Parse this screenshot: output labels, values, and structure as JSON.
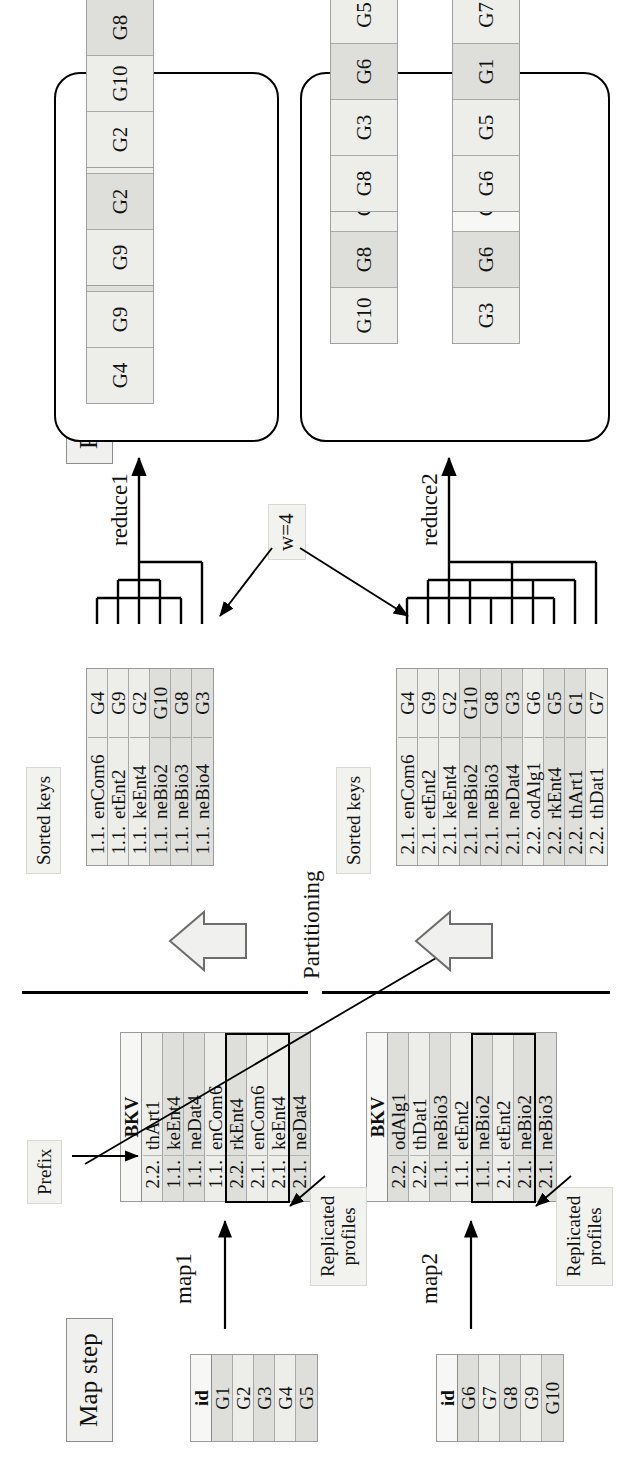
{
  "figure": {
    "orientation": "rotated-90-ccw",
    "steps": {
      "map_label": "Map step",
      "reduce_label": "Reduce step",
      "partitioning_label": "Partitioning",
      "window_label": "w=4"
    },
    "annotations": {
      "prefix": "Prefix",
      "replicated_profiles_line1": "Replicated",
      "replicated_profiles_line2": "profiles",
      "map1": "map1",
      "map2": "map2",
      "reduce1": "reduce1",
      "reduce2": "reduce2",
      "sorted_keys": "Sorted keys"
    }
  },
  "input_tables": [
    {
      "name": "input-block-1",
      "header": "id",
      "rows": [
        {
          "value": "G1",
          "shade": "dark"
        },
        {
          "value": "G2",
          "shade": "light"
        },
        {
          "value": "G3",
          "shade": "dark"
        },
        {
          "value": "G4",
          "shade": "light"
        },
        {
          "value": "G5",
          "shade": "dark"
        }
      ]
    },
    {
      "name": "input-block-2",
      "header": "id",
      "rows": [
        {
          "value": "G6",
          "shade": "dark"
        },
        {
          "value": "G7",
          "shade": "light"
        },
        {
          "value": "G8",
          "shade": "dark"
        },
        {
          "value": "G9",
          "shade": "light"
        },
        {
          "value": "G10",
          "shade": "dark"
        }
      ]
    }
  ],
  "map_outputs": [
    {
      "name": "map1-bkv",
      "header": "BKV",
      "rows": [
        {
          "prefix": "2.2.",
          "key": "thArt1",
          "shade": "light",
          "replicated": false
        },
        {
          "prefix": "1.1.",
          "key": "keEnt4",
          "shade": "dark",
          "replicated": false
        },
        {
          "prefix": "1.1.",
          "key": "neDat4",
          "shade": "dark",
          "replicated": false
        },
        {
          "prefix": "1.1.",
          "key": "enCom6",
          "shade": "light",
          "replicated": false
        },
        {
          "prefix": "2.2.",
          "key": "rkEnt4",
          "shade": "dark",
          "replicated": false
        },
        {
          "prefix": "2.1.",
          "key": "enCom6",
          "shade": "light",
          "replicated": true
        },
        {
          "prefix": "2.1.",
          "key": "keEnt4",
          "shade": "light",
          "replicated": true
        },
        {
          "prefix": "2.1.",
          "key": "neDat4",
          "shade": "dark",
          "replicated": true
        }
      ]
    },
    {
      "name": "map2-bkv",
      "header": "BKV",
      "rows": [
        {
          "prefix": "2.2.",
          "key": "odAlg1",
          "shade": "dark",
          "replicated": false
        },
        {
          "prefix": "2.2.",
          "key": "thDat1",
          "shade": "light",
          "replicated": false
        },
        {
          "prefix": "1.1.",
          "key": "neBio3",
          "shade": "dark",
          "replicated": false
        },
        {
          "prefix": "1.1.",
          "key": "etEnt2",
          "shade": "light",
          "replicated": false
        },
        {
          "prefix": "1.1.",
          "key": "neBio2",
          "shade": "dark",
          "replicated": false
        },
        {
          "prefix": "2.1.",
          "key": "etEnt2",
          "shade": "light",
          "replicated": true
        },
        {
          "prefix": "2.1.",
          "key": "neBio2",
          "shade": "dark",
          "replicated": true
        },
        {
          "prefix": "2.1.",
          "key": "neBio3",
          "shade": "dark",
          "replicated": true
        }
      ]
    }
  ],
  "sorted_key_tables": [
    {
      "name": "sorted-keys-1",
      "label": "Sorted keys",
      "rows": [
        {
          "prefix": "1.1.",
          "key": "enCom6",
          "group": "G4",
          "shade": "light"
        },
        {
          "prefix": "1.1.",
          "key": "etEnt2",
          "group": "G9",
          "shade": "light"
        },
        {
          "prefix": "1.1.",
          "key": "keEnt4",
          "group": "G2",
          "shade": "light"
        },
        {
          "prefix": "1.1.",
          "key": "neBio2",
          "group": "G10",
          "shade": "dark"
        },
        {
          "prefix": "1.1.",
          "key": "neBio3",
          "group": "G8",
          "shade": "dark"
        },
        {
          "prefix": "1.1.",
          "key": "neBio4",
          "group": "G3",
          "shade": "dark"
        }
      ]
    },
    {
      "name": "sorted-keys-2",
      "label": "Sorted keys",
      "rows": [
        {
          "prefix": "2.1.",
          "key": "enCom6",
          "group": "G4",
          "shade": "light"
        },
        {
          "prefix": "2.1.",
          "key": "etEnt2",
          "group": "G9",
          "shade": "light"
        },
        {
          "prefix": "2.1.",
          "key": "keEnt4",
          "group": "G2",
          "shade": "light"
        },
        {
          "prefix": "2.1.",
          "key": "neBio2",
          "group": "G10",
          "shade": "dark"
        },
        {
          "prefix": "2.1.",
          "key": "neBio3",
          "group": "G8",
          "shade": "dark"
        },
        {
          "prefix": "2.1.",
          "key": "neDat4",
          "group": "G3",
          "shade": "dark"
        },
        {
          "prefix": "2.2.",
          "key": "odAlg1",
          "group": "G6",
          "shade": "light"
        },
        {
          "prefix": "2.2.",
          "key": "rkEnt4",
          "group": "G5",
          "shade": "dark"
        },
        {
          "prefix": "2.2.",
          "key": "thArt1",
          "group": "G1",
          "shade": "dark"
        },
        {
          "prefix": "2.2.",
          "key": "thDat1",
          "group": "G7",
          "shade": "light"
        }
      ]
    }
  ],
  "reducers": [
    {
      "name": "reducer-1",
      "label": "reduce1",
      "windows": [
        {
          "cells": [
            {
              "value": "G4",
              "shade": "light"
            },
            {
              "value": "G9",
              "shade": "light"
            },
            {
              "value": "G2",
              "shade": "dark"
            },
            {
              "value": "G10",
              "shade": "light"
            }
          ]
        },
        {
          "cells": [
            {
              "value": "G9",
              "shade": "light"
            },
            {
              "value": "G2",
              "shade": "dark"
            },
            {
              "value": "G10",
              "shade": "light"
            },
            {
              "value": "G8",
              "shade": "dark"
            }
          ]
        },
        {
          "cells": [
            {
              "value": "G2",
              "shade": "light"
            },
            {
              "value": "G10",
              "shade": "light"
            },
            {
              "value": "G8",
              "shade": "dark"
            },
            {
              "value": "G3",
              "shade": "light"
            }
          ]
        }
      ]
    },
    {
      "name": "reducer-2",
      "label": "reduce2",
      "windows": [
        {
          "cells": [
            {
              "value": "G10",
              "shade": "light"
            },
            {
              "value": "G8",
              "shade": "dark"
            },
            {
              "value": "G3",
              "shade": "light"
            },
            {
              "value": "G6",
              "shade": "dark"
            }
          ]
        },
        {
          "cells": [
            {
              "value": "G3",
              "shade": "light"
            },
            {
              "value": "G6",
              "shade": "dark"
            },
            {
              "value": "G5",
              "shade": "white"
            },
            {
              "value": "G1",
              "shade": "dark"
            }
          ]
        },
        {
          "cells": [
            {
              "value": "G8",
              "shade": "light"
            },
            {
              "value": "G3",
              "shade": "light"
            },
            {
              "value": "G6",
              "shade": "dark"
            },
            {
              "value": "G5",
              "shade": "light"
            }
          ]
        },
        {
          "cells": [
            {
              "value": "G6",
              "shade": "light"
            },
            {
              "value": "G5",
              "shade": "light"
            },
            {
              "value": "G1",
              "shade": "dark"
            },
            {
              "value": "G7",
              "shade": "light"
            }
          ]
        }
      ]
    }
  ]
}
